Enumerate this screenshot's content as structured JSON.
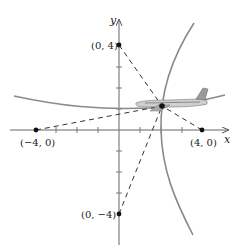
{
  "diagram": {
    "axes": {
      "x_label": "x",
      "y_label": "y"
    },
    "points": [
      {
        "id": "p_top",
        "label": "(0, 4)",
        "coords": [
          0,
          4
        ]
      },
      {
        "id": "p_bottom",
        "label": "(0, −4)",
        "coords": [
          0,
          -4
        ]
      },
      {
        "id": "p_left",
        "label": "(−4, 0)",
        "coords": [
          -4,
          0
        ]
      },
      {
        "id": "p_right",
        "label": "(4, 0)",
        "coords": [
          4,
          0
        ]
      }
    ],
    "aircraft": {
      "icon": "airplane-icon",
      "position": "intersection of two hyperbola branches"
    },
    "colors": {
      "curve": "#8a8a8a",
      "axis": "#555555",
      "dash": "#333333",
      "point": "#111111"
    }
  }
}
